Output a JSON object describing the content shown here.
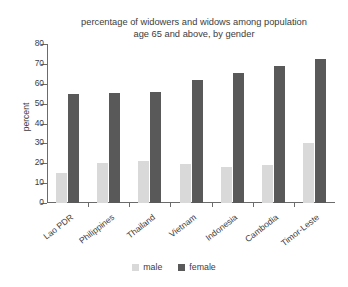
{
  "chart_data": {
    "type": "bar",
    "title": "percentage of widowers and widows among population\nage 65 and above, by gender",
    "xlabel": "",
    "ylabel": "percent",
    "ylim": [
      0,
      80
    ],
    "yticks": [
      0,
      10,
      20,
      30,
      40,
      50,
      60,
      70,
      80
    ],
    "grid": false,
    "legend_position": "bottom-center",
    "categories": [
      "Lao PDR",
      "Philippines",
      "Thailand",
      "Vietnam",
      "Indonesia",
      "Cambodia",
      "Timor-Leste"
    ],
    "series": [
      {
        "name": "male",
        "color": "#d9d9d9",
        "values": [
          15,
          20,
          21,
          19.5,
          18,
          19,
          30
        ]
      },
      {
        "name": "female",
        "color": "#595959",
        "values": [
          55,
          55.5,
          56,
          62,
          65.5,
          69,
          72.5
        ]
      }
    ]
  },
  "colors": {
    "male": "#d9d9d9",
    "female": "#595959",
    "axis": "#6b6b6b",
    "text": "#3c3c3c",
    "background": "#ffffff"
  }
}
